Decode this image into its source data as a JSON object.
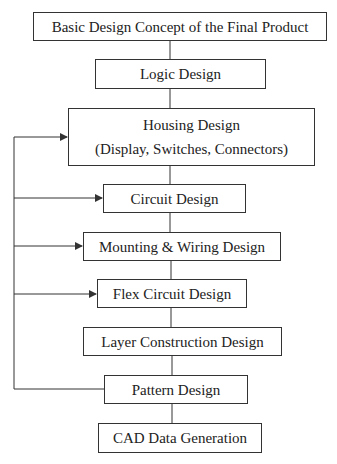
{
  "diagram": {
    "type": "flowchart",
    "nodes": [
      {
        "id": "n1",
        "label": "Basic Design Concept of the Final Product",
        "box": [
          33,
          12,
          294,
          29
        ]
      },
      {
        "id": "n2",
        "label": "Logic Design",
        "box": [
          95,
          59,
          171,
          30
        ]
      },
      {
        "id": "n3",
        "label": "Housing Design",
        "label2": "(Display, Switches, Connectors)",
        "box": [
          68,
          108,
          247,
          58
        ]
      },
      {
        "id": "n4",
        "label": "Circuit Design",
        "box": [
          103,
          184,
          143,
          29
        ]
      },
      {
        "id": "n5",
        "label": "Mounting & Wiring Design",
        "box": [
          83,
          232,
          198,
          29
        ]
      },
      {
        "id": "n6",
        "label": "Flex Circuit Design",
        "box": [
          97,
          279,
          150,
          29
        ]
      },
      {
        "id": "n7",
        "label": "Layer Construction Design",
        "box": [
          83,
          327,
          199,
          29
        ]
      },
      {
        "id": "n8",
        "label": "Pattern Design",
        "box": [
          104,
          375,
          144,
          29
        ]
      },
      {
        "id": "n9",
        "label": "CAD Data Generation",
        "box": [
          98,
          423,
          164,
          30
        ]
      }
    ],
    "edges": [
      {
        "from": "n1",
        "to": "n2",
        "kind": "line"
      },
      {
        "from": "n2",
        "to": "n3",
        "kind": "line"
      },
      {
        "from": "n3",
        "to": "n4",
        "kind": "line"
      },
      {
        "from": "n4",
        "to": "n5",
        "kind": "line"
      },
      {
        "from": "n5",
        "to": "n6",
        "kind": "line"
      },
      {
        "from": "n6",
        "to": "n7",
        "kind": "line"
      },
      {
        "from": "n7",
        "to": "n8",
        "kind": "line"
      },
      {
        "from": "n8",
        "to": "n9",
        "kind": "line"
      },
      {
        "from": "n8",
        "to": "n3",
        "kind": "feedback-arrow"
      },
      {
        "from": "n8",
        "to": "n4",
        "kind": "feedback-arrow"
      },
      {
        "from": "n8",
        "to": "n5",
        "kind": "feedback-arrow"
      },
      {
        "from": "n8",
        "to": "n6",
        "kind": "feedback-arrow"
      }
    ],
    "colors": {
      "line": "#333333",
      "background": "#ffffff",
      "text": "#222222"
    }
  }
}
